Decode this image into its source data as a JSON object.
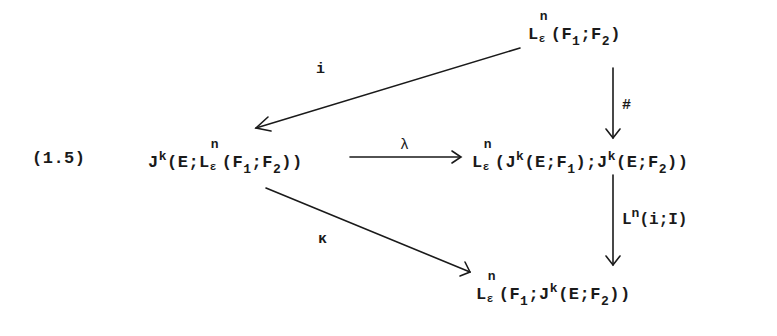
{
  "diagram": {
    "equation_number": "(1.5)",
    "nodes": {
      "top_right": {
        "base": "L",
        "sup": "n",
        "sub": "ε",
        "arg_open": "(F",
        "arg_sub1": "1",
        "arg_mid": ";F",
        "arg_sub2": "2",
        "arg_close": ")"
      },
      "left": {
        "base": "J",
        "sup": "k",
        "pre": "(E;L",
        "inner_sup": "n",
        "inner_sub": "ε",
        "arg_open": "(F",
        "arg_sub1": "1",
        "arg_mid": ";F",
        "arg_sub2": "2",
        "arg_close": "))"
      },
      "middle_right": {
        "base": "L",
        "sup": "n",
        "sub": "ε",
        "part1": "(J",
        "part1_sup": "k",
        "part2": "(E;F",
        "part2_sub": "1",
        "part3": ");J",
        "part3_sup": "k",
        "part4": "(E;F",
        "part4_sub": "2",
        "part5": "))"
      },
      "bottom_right": {
        "base": "L",
        "sup": "n",
        "sub": "ε",
        "part1": "(F",
        "part1_sub": "1",
        "part2": ";J",
        "part2_sup": "k",
        "part3": "(E;F",
        "part3_sub": "2",
        "part4": "))"
      }
    },
    "arrows": [
      {
        "from": "top_right",
        "to": "left",
        "label": "i"
      },
      {
        "from": "left",
        "to": "middle_right",
        "label": "λ"
      },
      {
        "from": "top_right",
        "to": "middle_right",
        "label": "#"
      },
      {
        "from": "middle_right",
        "to": "bottom_right",
        "label_base": "L",
        "label_sup": "n",
        "label_args": "(i;I)"
      },
      {
        "from": "left",
        "to": "bottom_right",
        "label": "κ"
      }
    ]
  }
}
